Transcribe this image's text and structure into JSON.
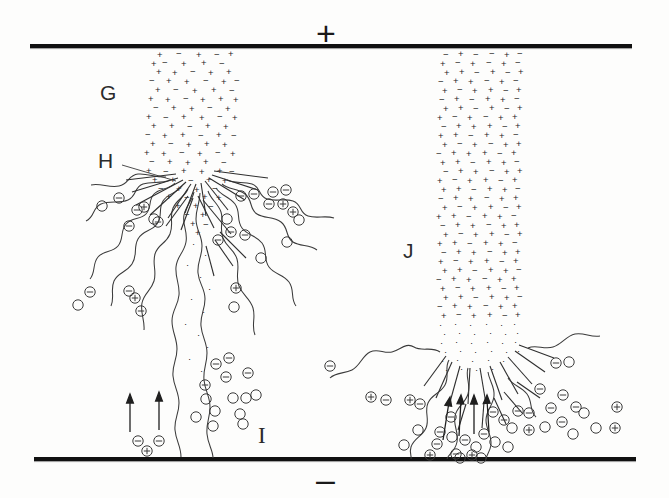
{
  "figure": {
    "background_color": "#fdfdfc",
    "ink_color": "#1a1a1a",
    "width": 669,
    "height": 498
  },
  "electrodes": {
    "top": {
      "name": "upper electrode",
      "polarity_symbol": "+",
      "y": 46,
      "x_start": 30,
      "x_end": 632,
      "thickness": 4,
      "color": "#111111"
    },
    "bottom": {
      "name": "lower electrode",
      "polarity_symbol": "–",
      "y": 459,
      "x_start": 34,
      "x_end": 636,
      "thickness": 4,
      "color": "#111111"
    }
  },
  "labels": [
    {
      "id": "G",
      "text": "G",
      "x": 100,
      "y": 82,
      "description": "dense charged region of left jet",
      "leader": false
    },
    {
      "id": "H",
      "text": "H",
      "x": 98,
      "y": 150,
      "description": "breakup / chain emission zone of left jet",
      "leader": true
    },
    {
      "id": "I",
      "text": "I",
      "x": 258,
      "y": 424,
      "description": "charged droplets near lower electrode",
      "leader": false
    },
    {
      "id": "J",
      "text": "J",
      "x": 403,
      "y": 240,
      "description": "dense charged column of right jet",
      "leader": false
    }
  ],
  "jets": {
    "left": {
      "name": "left jet",
      "column_x_center": 190,
      "column_width": 72,
      "column_top": 50,
      "column_bottom": 200,
      "breakup_y": 185,
      "symbol_density": "high",
      "symbols": [
        "+",
        "−"
      ]
    },
    "right": {
      "name": "right jet",
      "column_x_center": 475,
      "column_width": 80,
      "column_top": 50,
      "column_bottom": 350,
      "breakup_y": 350,
      "symbol_density": "high",
      "symbols": [
        "+",
        "−"
      ]
    }
  },
  "markers": {
    "circled_minus": "⊖",
    "circled_plus": "⊕",
    "circle_empty": "○",
    "arrow_direction": "up"
  },
  "counts": {
    "arrows_left": 2,
    "arrows_right": 4,
    "wavy_chains_left": 9,
    "wavy_chains_right": 4
  }
}
